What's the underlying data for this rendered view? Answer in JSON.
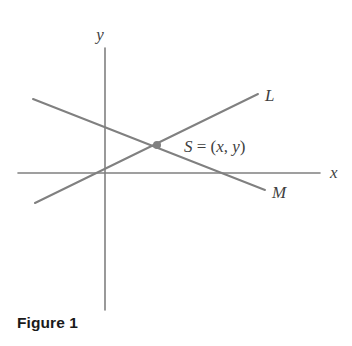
{
  "figure": {
    "caption": "Figure 1",
    "background_color": "#ffffff",
    "line_color": "#808080",
    "axis_color": "#808080",
    "label_color": "#3f3f3f",
    "caption_color": "#1a1a1a"
  },
  "axes": {
    "x_axis": {
      "label": "x",
      "y_pixel": 173,
      "x_start": 18,
      "x_end": 320,
      "label_x": 330,
      "label_y": 178
    },
    "y_axis": {
      "label": "y",
      "x_pixel": 105,
      "y_start": 48,
      "y_end": 310,
      "label_x": 100,
      "label_y": 40
    },
    "origin": {
      "x": 105,
      "y": 173
    }
  },
  "lines": [
    {
      "name": "L",
      "label": "L",
      "description": "line through the origin with positive slope",
      "x1": 35,
      "y1": 203,
      "x2": 258,
      "y2": 94,
      "label_x": 265,
      "label_y": 101
    },
    {
      "name": "M",
      "label": "M",
      "description": "line with negative slope crossing the x-axis right of the origin",
      "x1": 33,
      "y1": 99,
      "x2": 265,
      "y2": 190,
      "label_x": 272,
      "label_y": 198
    }
  ],
  "points": [
    {
      "name": "S",
      "label_parts": {
        "point": "S",
        "equals": " = (",
        "x": "x",
        "comma": ", ",
        "y": "y",
        "close": ")"
      },
      "label_full": "S = (x, y)",
      "x": 157,
      "y": 145,
      "label_x": 184,
      "label_y": 152,
      "marker_radius": 4,
      "marker_color": "#808080"
    }
  ]
}
